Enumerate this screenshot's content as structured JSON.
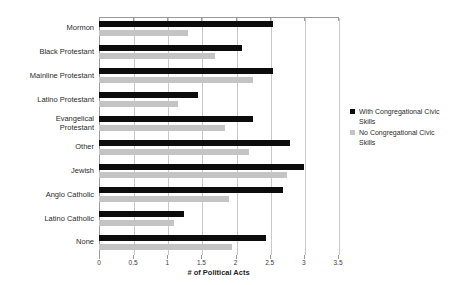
{
  "chart_data": {
    "type": "bar",
    "orientation": "horizontal",
    "title": "",
    "xlabel": "# of Political Acts",
    "ylabel": "",
    "xlim": [
      0,
      3.5
    ],
    "xticks": [
      "0",
      "0.5",
      "1",
      "1.5",
      "2",
      "2.5",
      "3",
      "3.5"
    ],
    "xtick_values": [
      0,
      0.5,
      1,
      1.5,
      2,
      2.5,
      3,
      3.5
    ],
    "grid": true,
    "legend_position": "right",
    "categories": [
      "Mormon",
      "Black Protestant",
      "Mainline Protestant",
      "Latino Protestant",
      "Evangelical\nProtestant",
      "Other",
      "Jewish",
      "Anglo Catholic",
      "Latino Catholic",
      "None"
    ],
    "series": [
      {
        "name": "With Congregational Civic Skills",
        "color": "#0c0c0c",
        "values": [
          2.55,
          2.1,
          2.55,
          1.45,
          2.25,
          2.8,
          3.0,
          2.7,
          1.25,
          2.45
        ]
      },
      {
        "name": "No Congregational Civic Skills",
        "color": "#c4c4c4",
        "values": [
          1.3,
          1.7,
          2.25,
          1.15,
          1.85,
          2.2,
          2.75,
          1.9,
          1.1,
          1.95
        ]
      }
    ]
  },
  "legend": {
    "items": [
      {
        "label": "With Congregational Civic Skills",
        "swatch": "black"
      },
      {
        "label": "No Congregational Civic Skills",
        "swatch": "gray"
      }
    ]
  }
}
